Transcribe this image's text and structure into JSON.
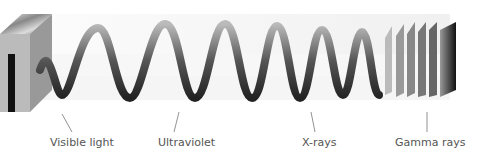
{
  "diagram": {
    "type": "electromagnetic-wave-illustration",
    "labels": [
      {
        "text": "Visible light",
        "x": 50,
        "leader_from": [
          62,
          114
        ],
        "leader_to": [
          72,
          132
        ]
      },
      {
        "text": "Ultraviolet",
        "x": 158,
        "leader_from": [
          179,
          112
        ],
        "leader_to": [
          174,
          132
        ]
      },
      {
        "text": "X-rays",
        "x": 302,
        "leader_from": [
          311,
          112
        ],
        "leader_to": [
          315,
          132
        ]
      },
      {
        "text": "Gamma rays",
        "x": 395,
        "leader_from": [
          427,
          112
        ],
        "leader_to": [
          427,
          132
        ]
      }
    ]
  }
}
